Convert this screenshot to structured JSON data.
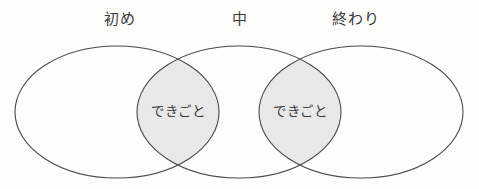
{
  "diagram": {
    "type": "venn",
    "title": "",
    "background_color": "#fdfdfc",
    "stroke_color": "#4a4a4a",
    "overlap_fill_color": "#e8e8e8",
    "text_color": "#3a3a3a",
    "stage_labels": [
      {
        "text": "初め",
        "x": 120,
        "y": 12
      },
      {
        "text": "中",
        "x": 240,
        "y": 12
      },
      {
        "text": "終わり",
        "x": 356,
        "y": 12
      }
    ],
    "ellipses": [
      {
        "name": "beginning-ellipse",
        "cx": 117,
        "cy": 112,
        "rx": 102,
        "ry": 66
      },
      {
        "name": "middle-ellipse",
        "cx": 239,
        "cy": 112,
        "rx": 102,
        "ry": 66
      },
      {
        "name": "end-ellipse",
        "cx": 361,
        "cy": 112,
        "rx": 102,
        "ry": 66
      }
    ],
    "overlap_regions": [
      {
        "name": "left-overlap",
        "text": "できごと",
        "cx": 178,
        "cy": 112
      },
      {
        "name": "right-overlap",
        "text": "できごと",
        "cx": 300,
        "cy": 112
      }
    ]
  }
}
